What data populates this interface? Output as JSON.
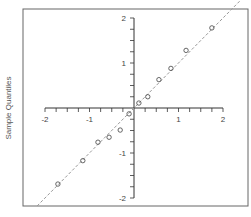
{
  "chart_data": {
    "type": "scatter",
    "title": "",
    "xlabel": "",
    "ylabel": "Sample Quantiles",
    "xlim": [
      -2.0,
      2.3
    ],
    "ylim": [
      -2.2,
      2.2
    ],
    "x_ticks": [
      -2,
      -1,
      0,
      1,
      2
    ],
    "y_ticks": [
      -2,
      -1,
      0,
      1,
      2
    ],
    "x_tick_labels": [
      "-2",
      "-1",
      "1",
      "2"
    ],
    "y_tick_labels": [
      "2",
      "1",
      "-1",
      "-2"
    ],
    "minor_tick_step": 0.25,
    "grid": false,
    "axes_through_origin": true,
    "series": [
      {
        "name": "sample",
        "marker": "open-circle",
        "x": [
          -1.71,
          -1.15,
          -0.81,
          -0.56,
          -0.31,
          -0.11,
          0.11,
          0.31,
          0.56,
          0.83,
          1.17,
          1.75
        ],
        "y": [
          -1.69,
          -1.17,
          -0.76,
          -0.65,
          -0.49,
          -0.13,
          0.11,
          0.25,
          0.63,
          0.88,
          1.28,
          1.78
        ]
      }
    ],
    "reference_line": {
      "style": "dashed",
      "slope": 1.0,
      "intercept": 0.0
    },
    "colors": {
      "points": "#555555",
      "line": "#999999",
      "axes": "#333333",
      "frame": "#666666"
    }
  }
}
